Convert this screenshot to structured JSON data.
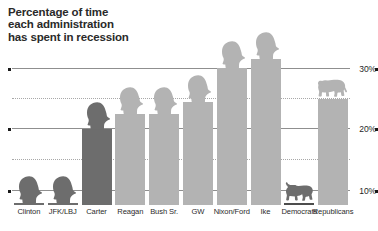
{
  "title": "Percentage of time\neach administration\nhas spent in recession",
  "chart_data": {
    "type": "bar",
    "title": "Percentage of time each administration has spent in recession",
    "xlabel": "",
    "ylabel": "",
    "ylim": [
      0,
      34
    ],
    "grid": true,
    "legend": false,
    "categories": [
      "Clinton",
      "JFK/LBJ",
      "Carter",
      "Reagan",
      "Bush Sr.",
      "GW",
      "Nixon/Ford",
      "Ike",
      "Democrats",
      "Republicans"
    ],
    "values": [
      3.5,
      6.0,
      20.0,
      22.5,
      22.5,
      24.5,
      30.0,
      31.5,
      4.5,
      25.0
    ],
    "bar_styles": [
      "dark",
      "dark",
      "dark",
      "light",
      "light",
      "light",
      "light",
      "light",
      "darker",
      "light"
    ],
    "icons": [
      "head-silhouette",
      "head-silhouette",
      "head-silhouette",
      "head-silhouette",
      "head-silhouette",
      "head-silhouette",
      "head-silhouette",
      "head-silhouette",
      "donkey-icon",
      "elephant-icon"
    ],
    "ytick_labels": [
      "30%",
      "20%",
      "10%"
    ],
    "ytick_values": [
      30,
      20,
      10
    ],
    "minor_gridline_values": [
      25,
      15,
      5
    ]
  },
  "colors": {
    "bar_light": "#b3b3b3",
    "bar_dark": "#6d6d6d",
    "bar_darker": "#4d4d4d",
    "gridline": "#8f8f8f",
    "gridline_dotted": "#a8a8a8",
    "text": "#2a2a2a",
    "background": "#ffffff"
  }
}
